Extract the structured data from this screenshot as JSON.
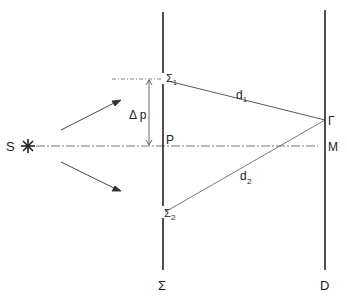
{
  "diagram": {
    "labels": {
      "source": "S",
      "slit1": "Σ",
      "slit1_sub": "1",
      "slit2": "Σ",
      "slit2_sub": "2",
      "delta_p": "Δ p",
      "point_p": "P",
      "path1": "d",
      "path1_sub": "1",
      "path2": "d",
      "path2_sub": "2",
      "point_gamma": "Γ",
      "point_m": "M",
      "screen_sigma": "Σ",
      "screen_d": "D"
    },
    "colors": {
      "ink": "#222222",
      "thin_ink": "#555555",
      "background": "#ffffff"
    }
  }
}
